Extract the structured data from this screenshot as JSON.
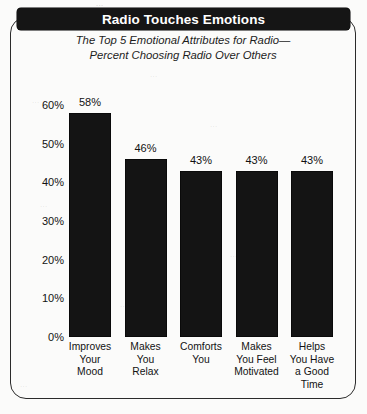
{
  "figure": {
    "title": "Radio Touches Emotions",
    "subtitle_line1": "The Top 5 Emotional Attributes for Radio—",
    "subtitle_line2": "Percent Choosing Radio Over Others"
  },
  "chart_data": {
    "type": "bar",
    "title": "Radio Touches Emotions",
    "subtitle": "The Top 5 Emotional Attributes for Radio—Percent Choosing Radio Over Others",
    "xlabel": "",
    "ylabel": "",
    "ylim": [
      0,
      60
    ],
    "ytick_labels": [
      "60%",
      "50%",
      "40%",
      "30%",
      "20%",
      "10%",
      "0%"
    ],
    "ytick_values": [
      60,
      50,
      40,
      30,
      20,
      10,
      0
    ],
    "grid": false,
    "legend": false,
    "bar_color": "#141414",
    "categories": [
      "Improves Your Mood",
      "Makes You Relax",
      "Comforts You",
      "Makes You Feel Motivated",
      "Helps You Have a Good Time"
    ],
    "category_lines": [
      [
        "Improves",
        "Your",
        "Mood"
      ],
      [
        "Makes",
        "You",
        "Relax"
      ],
      [
        "Comforts",
        "You"
      ],
      [
        "Makes",
        "You Feel",
        "Motivated"
      ],
      [
        "Helps",
        "You Have",
        "a Good",
        "Time"
      ]
    ],
    "values": [
      58,
      46,
      43,
      43,
      43
    ],
    "value_labels": [
      "58%",
      "46%",
      "43%",
      "43%",
      "43%"
    ]
  },
  "bleed_text": {
    "t1": "...",
    "t2": "...",
    "t3": "...",
    "t4": "...",
    "t5": "...",
    "t6": "...",
    "t7": "...",
    "t8": "..."
  }
}
